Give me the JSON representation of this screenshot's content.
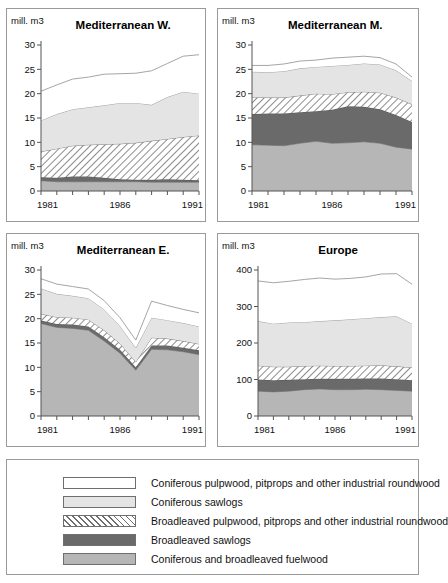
{
  "figure": {
    "unit_label": "mill. m3",
    "x_tick_labels": [
      "1981",
      "1986",
      "1991"
    ]
  },
  "legend": {
    "items": [
      {
        "swatch": "conif-pulp",
        "label": "Coniferous pulpwood, pitprops and other industrial roundwood",
        "color": "#ffffff"
      },
      {
        "swatch": "conif-saw",
        "label": "Coniferous  sawlogs",
        "color": "#e4e4e4"
      },
      {
        "swatch": "broad-pulp",
        "label": "Broadleaved pulpwood, pitprops and other industrial roundwood",
        "color": "#ffffff"
      },
      {
        "swatch": "broad-saw",
        "label": "Broadleaved sawlogs",
        "color": "#6a6a6a"
      },
      {
        "swatch": "fuel",
        "label": "Coniferous  and broadleaved fuelwood",
        "color": "#b6b6b6"
      }
    ]
  },
  "chart_data": [
    {
      "type": "area",
      "title": "Mediterranean W.",
      "xlabel": "",
      "ylabel": "mill. m3",
      "x": [
        1981,
        1982,
        1983,
        1984,
        1985,
        1986,
        1987,
        1988,
        1989,
        1990,
        1991
      ],
      "xlim": [
        1981,
        1991
      ],
      "ylim": [
        0,
        30
      ],
      "yticks": [
        0,
        5,
        10,
        15,
        20,
        25,
        30
      ],
      "xticks": [
        1981,
        1986,
        1991
      ],
      "grid": false,
      "legend_position": "bottom-shared",
      "stack_order_bottom_to_top": [
        "Coniferous and broadleaved fuelwood",
        "Broadleaved sawlogs",
        "Broadleaved pulpwood, pitprops and other industrial roundwood",
        "Coniferous sawlogs",
        "Coniferous pulpwood, pitprops and other industrial roundwood"
      ],
      "series": [
        {
          "name": "Coniferous  and broadleaved fuelwood",
          "values": [
            2.1,
            1.9,
            1.9,
            1.9,
            1.9,
            1.9,
            1.9,
            1.8,
            1.8,
            1.8,
            1.8
          ]
        },
        {
          "name": "Broadleaved sawlogs",
          "values": [
            0.7,
            0.8,
            1.1,
            1.1,
            0.8,
            0.5,
            0.4,
            0.5,
            0.6,
            0.5,
            0.4
          ]
        },
        {
          "name": "Broadleaved pulpwood, pitprops and other industrial roundwood",
          "values": [
            5.3,
            6.0,
            6.3,
            6.5,
            6.9,
            7.3,
            7.6,
            8.0,
            8.3,
            8.8,
            9.2
          ]
        },
        {
          "name": "Coniferous  sawlogs",
          "values": [
            6.4,
            7.1,
            7.5,
            7.7,
            8.0,
            8.4,
            8.2,
            7.4,
            8.6,
            9.3,
            8.6
          ]
        },
        {
          "name": "Coniferous pulpwood, pitprops and other industrial roundwood",
          "values": [
            6.0,
            6.0,
            6.2,
            6.2,
            6.4,
            6.0,
            6.1,
            7.0,
            6.9,
            7.3,
            8.0
          ]
        }
      ],
      "totals": [
        20.5,
        21.8,
        23.0,
        23.4,
        24.0,
        24.1,
        24.2,
        24.7,
        26.2,
        27.7,
        28.0
      ]
    },
    {
      "type": "area",
      "title": "Mediterranean M.",
      "xlabel": "",
      "ylabel": "mill. m3",
      "x": [
        1981,
        1982,
        1983,
        1984,
        1985,
        1986,
        1987,
        1988,
        1989,
        1990,
        1991
      ],
      "xlim": [
        1981,
        1991
      ],
      "ylim": [
        0,
        30
      ],
      "yticks": [
        0,
        5,
        10,
        15,
        20,
        25,
        30
      ],
      "xticks": [
        1981,
        1986,
        1991
      ],
      "grid": false,
      "legend_position": "bottom-shared",
      "stack_order_bottom_to_top": [
        "Coniferous and broadleaved fuelwood",
        "Broadleaved sawlogs",
        "Broadleaved pulpwood, pitprops and other industrial roundwood",
        "Coniferous sawlogs",
        "Coniferous pulpwood, pitprops and other industrial roundwood"
      ],
      "series": [
        {
          "name": "Coniferous  and broadleaved fuelwood",
          "values": [
            9.5,
            9.4,
            9.3,
            9.8,
            10.2,
            9.8,
            9.9,
            10.1,
            9.8,
            9.0,
            8.6
          ]
        },
        {
          "name": "Broadleaved sawlogs",
          "values": [
            6.3,
            6.5,
            6.6,
            6.4,
            6.2,
            6.9,
            7.5,
            7.2,
            7.0,
            6.6,
            5.6
          ]
        },
        {
          "name": "Broadleaved pulpwood, pitprops and other industrial roundwood",
          "values": [
            3.5,
            3.3,
            3.3,
            3.4,
            3.6,
            3.2,
            2.9,
            3.1,
            3.4,
            3.6,
            3.6
          ]
        },
        {
          "name": "Coniferous  sawlogs",
          "values": [
            5.2,
            5.2,
            5.4,
            5.6,
            5.5,
            5.8,
            5.6,
            5.8,
            5.8,
            5.6,
            4.8
          ]
        },
        {
          "name": "Coniferous pulpwood, pitprops and other industrial roundwood",
          "values": [
            1.3,
            1.4,
            1.5,
            1.5,
            1.4,
            1.6,
            1.6,
            1.5,
            1.4,
            1.3,
            0.8
          ]
        }
      ],
      "totals": [
        25.8,
        25.8,
        26.1,
        26.7,
        26.9,
        27.3,
        27.5,
        27.7,
        27.4,
        26.1,
        23.4
      ]
    },
    {
      "type": "area",
      "title": "Mediterranean E.",
      "xlabel": "",
      "ylabel": "mill. m3",
      "x": [
        1981,
        1982,
        1983,
        1984,
        1985,
        1986,
        1987,
        1988,
        1989,
        1990,
        1991
      ],
      "xlim": [
        1981,
        1991
      ],
      "ylim": [
        0,
        30
      ],
      "yticks": [
        0,
        5,
        10,
        15,
        20,
        25,
        30
      ],
      "xticks": [
        1981,
        1986,
        1991
      ],
      "grid": false,
      "legend_position": "bottom-shared",
      "stack_order_bottom_to_top": [
        "Coniferous and broadleaved fuelwood",
        "Broadleaved sawlogs",
        "Broadleaved pulpwood, pitprops and other industrial roundwood",
        "Coniferous sawlogs",
        "Coniferous pulpwood, pitprops and other industrial roundwood"
      ],
      "series": [
        {
          "name": "Coniferous  and broadleaved fuelwood",
          "values": [
            19.0,
            18.2,
            18.0,
            17.6,
            15.4,
            12.9,
            9.4,
            13.7,
            13.6,
            13.2,
            12.6
          ]
        },
        {
          "name": "Broadleaved sawlogs",
          "values": [
            0.6,
            0.7,
            0.8,
            0.8,
            0.8,
            0.7,
            0.6,
            0.8,
            0.9,
            0.8,
            0.9
          ]
        },
        {
          "name": "Broadleaved pulpwood, pitprops and other industrial roundwood",
          "values": [
            1.4,
            1.4,
            1.4,
            1.4,
            1.4,
            1.3,
            1.1,
            1.6,
            1.4,
            1.4,
            1.3
          ]
        },
        {
          "name": "Coniferous  sawlogs",
          "values": [
            5.2,
            4.8,
            4.5,
            4.4,
            4.3,
            3.6,
            2.9,
            4.1,
            3.8,
            3.7,
            3.6
          ]
        },
        {
          "name": "Coniferous pulpwood, pitprops and other industrial roundwood",
          "values": [
            2.0,
            2.0,
            1.9,
            1.9,
            1.8,
            1.7,
            1.6,
            3.4,
            3.0,
            2.8,
            2.8
          ]
        }
      ],
      "totals": [
        28.2,
        27.1,
        26.6,
        26.1,
        23.7,
        20.2,
        15.6,
        23.6,
        22.7,
        21.9,
        21.2
      ]
    },
    {
      "type": "area",
      "title": "Europe",
      "xlabel": "",
      "ylabel": "mill. m3",
      "x": [
        1981,
        1982,
        1983,
        1984,
        1985,
        1986,
        1987,
        1988,
        1989,
        1990,
        1991
      ],
      "xlim": [
        1981,
        1991
      ],
      "ylim": [
        0,
        400
      ],
      "yticks": [
        0,
        100,
        200,
        300,
        400
      ],
      "xticks": [
        1981,
        1986,
        1991
      ],
      "grid": false,
      "legend_position": "bottom-shared",
      "stack_order_bottom_to_top": [
        "Coniferous and broadleaved fuelwood",
        "Broadleaved sawlogs",
        "Broadleaved pulpwood, pitprops and other industrial roundwood",
        "Coniferous sawlogs",
        "Coniferous pulpwood, pitprops and other industrial roundwood"
      ],
      "series": [
        {
          "name": "Coniferous  and broadleaved fuelwood",
          "values": [
            68,
            66,
            68,
            72,
            74,
            72,
            72,
            73,
            72,
            70,
            68
          ]
        },
        {
          "name": "Broadleaved sawlogs",
          "values": [
            32,
            32,
            31,
            29,
            28,
            30,
            30,
            30,
            31,
            31,
            30
          ]
        },
        {
          "name": "Broadleaved pulpwood, pitprops and other industrial roundwood",
          "values": [
            38,
            37,
            36,
            36,
            36,
            35,
            35,
            35,
            36,
            35,
            35
          ]
        },
        {
          "name": "Coniferous  sawlogs",
          "values": [
            122,
            118,
            121,
            120,
            122,
            125,
            128,
            130,
            132,
            137,
            120
          ]
        },
        {
          "name": "Coniferous pulpwood, pitprops and other industrial roundwood",
          "values": [
            110,
            112,
            113,
            117,
            118,
            113,
            112,
            113,
            118,
            117,
            108
          ]
        }
      ],
      "totals": [
        370,
        365,
        369,
        374,
        378,
        375,
        377,
        381,
        389,
        390,
        361
      ]
    }
  ]
}
